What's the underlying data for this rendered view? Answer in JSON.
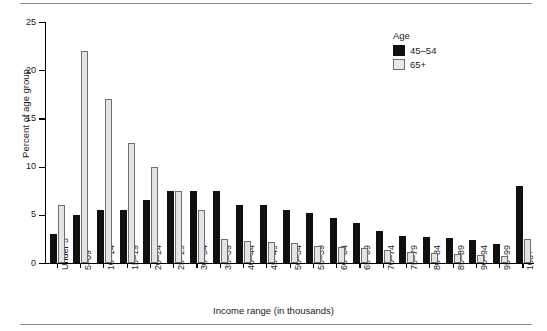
{
  "chart_data": {
    "type": "bar",
    "title": "",
    "xlabel": "Income range (in thousands)",
    "ylabel": "Percent of age group",
    "ylim": [
      0,
      25
    ],
    "yticks": [
      0,
      5,
      10,
      15,
      20,
      25
    ],
    "grid": false,
    "legend_position": "top-right",
    "legend_title": "Age",
    "categories": [
      "Under 5",
      "5–09",
      "10–14",
      "15–19",
      "20–24",
      "25–29",
      "30–34",
      "35–39",
      "40–44",
      "45–49",
      "50–54",
      "55–59",
      "60–64",
      "65–69",
      "70–74",
      "75–79",
      "80–84",
      "85–89",
      "90–94",
      "95–99",
      "100+"
    ],
    "series": [
      {
        "name": "45–54",
        "color": "#101010",
        "values": [
          3.0,
          5.0,
          5.5,
          5.5,
          6.5,
          7.5,
          7.5,
          7.5,
          6.0,
          6.0,
          5.5,
          5.2,
          4.7,
          4.2,
          3.3,
          2.8,
          2.7,
          2.6,
          2.4,
          2.0,
          8.0
        ]
      },
      {
        "name": "65+",
        "color": "#e4e4e4",
        "values": [
          6.0,
          22.0,
          17.0,
          12.5,
          10.0,
          7.5,
          5.5,
          2.5,
          2.3,
          2.2,
          2.1,
          1.8,
          1.7,
          1.6,
          1.3,
          1.1,
          1.0,
          0.9,
          0.8,
          0.7,
          2.5
        ]
      }
    ]
  },
  "axis": {
    "x_label": "Income range (in thousands)",
    "y_label": "Percent of age group"
  },
  "legend": {
    "title": "Age",
    "entries": [
      {
        "label": "45–54",
        "color": "#101010"
      },
      {
        "label": "65+",
        "color": "#e4e4e4"
      }
    ]
  }
}
